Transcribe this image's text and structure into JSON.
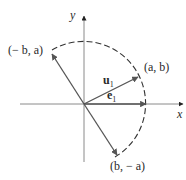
{
  "diagram": {
    "axes": {
      "x_label": "x",
      "y_label": "y"
    },
    "points": {
      "a_b": "(a, b)",
      "neg_b_a": "(− b, a)",
      "b_neg_a": "(b, − a)"
    },
    "vectors": {
      "u1_main": "u",
      "u1_sub": "1",
      "e1_main": "e",
      "e1_sub": "1"
    },
    "colors": {
      "axis": "#8a8a8a",
      "vector": "#555555",
      "arc": "#333333",
      "text": "#2a2a2a"
    }
  }
}
